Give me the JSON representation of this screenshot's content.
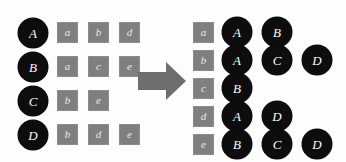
{
  "figure": {
    "type": "bipartite-mapping-inversion",
    "background_color": "#fdfdfd",
    "circle_color": "#0d0d0d",
    "circle_text_color": "#fbfbfb",
    "square_color": "#7f7f7f",
    "square_text_color": "#e8e8e8",
    "arrow_color": "#6e6e6e",
    "arrow_name": "right-arrow-icon",
    "arrow_direction": "right"
  },
  "left_panel": {
    "name": "forward-mapping",
    "key_type": "uppercase",
    "value_type": "lowercase",
    "rows": [
      {
        "key": "A",
        "values": [
          "a",
          "b",
          "d"
        ]
      },
      {
        "key": "B",
        "values": [
          "a",
          "c",
          "e"
        ]
      },
      {
        "key": "C",
        "values": [
          "b",
          "e"
        ]
      },
      {
        "key": "D",
        "values": [
          "b",
          "d",
          "e"
        ]
      }
    ]
  },
  "right_panel": {
    "name": "inverted-mapping",
    "key_type": "lowercase",
    "value_type": "uppercase",
    "rows": [
      {
        "key": "a",
        "values": [
          "A",
          "B"
        ]
      },
      {
        "key": "b",
        "values": [
          "A",
          "C",
          "D"
        ]
      },
      {
        "key": "c",
        "values": [
          "B"
        ]
      },
      {
        "key": "d",
        "values": [
          "A",
          "D"
        ]
      },
      {
        "key": "e",
        "values": [
          "B",
          "C",
          "D"
        ]
      }
    ]
  }
}
